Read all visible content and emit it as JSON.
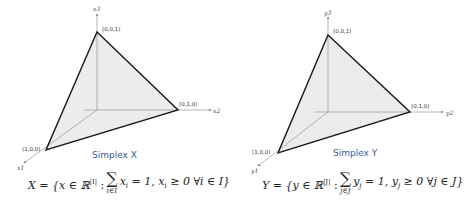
{
  "panels": [
    {
      "title": "Simplex X",
      "axes": {
        "up": "x3",
        "right": "x2",
        "diag": "x1"
      },
      "vertices": {
        "top": "(0,0,1)",
        "right": "(0,1,0)",
        "left": "(1,0,0)"
      },
      "formula": {
        "lhs": "X = {x ∈ ℝ",
        "sup": "|I|",
        "colon": " : ",
        "sum_symbol": "∑",
        "sum_sub": "i∈I",
        "rhs": "x",
        "rhs_sub": "i",
        "rest1": " = 1,  x",
        "rest_sub": "i",
        "rest2": " ≥ 0 ∀i ∈ I}"
      }
    },
    {
      "title": "Simplex Y",
      "axes": {
        "up": "y3",
        "right": "y2",
        "diag": "y1"
      },
      "vertices": {
        "top": "(0,0,1)",
        "right": "(0,1,0)",
        "left": "(1,0,0)"
      },
      "formula": {
        "lhs": "Y = {y ∈ ℝ",
        "sup": "|J|",
        "colon": " : ",
        "sum_symbol": "∑",
        "sum_sub": "j∈J",
        "rhs": "y",
        "rhs_sub": "j",
        "rest1": " = 1,  y",
        "rest_sub": "j",
        "rest2": " ≥ 0 ∀j ∈ J}"
      }
    }
  ],
  "colors": {
    "fill": "#ececec",
    "edge": "#1a1a1a",
    "axis": "#888888",
    "title": "#3b5a9a"
  }
}
